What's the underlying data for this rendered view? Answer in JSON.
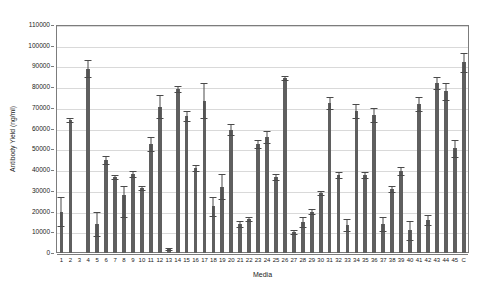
{
  "chart_data": {
    "type": "bar",
    "title": "",
    "xlabel": "Media",
    "ylabel": "Antibody Yield (ng/ml)",
    "ylim": [
      0,
      110000
    ],
    "ytick_step": 10000,
    "yticks": [
      "0",
      "10000",
      "20000",
      "30000",
      "40000",
      "50000",
      "60000",
      "70000",
      "80000",
      "90000",
      "100000",
      "110000"
    ],
    "grid": true,
    "legend": "none",
    "bar_color": "#5f5f5f",
    "error_bar_color": "#4a4a4a",
    "categories": [
      "1",
      "2",
      "3",
      "4",
      "5",
      "6",
      "7",
      "8",
      "9",
      "10",
      "11",
      "12",
      "13",
      "14",
      "15",
      "16",
      "17",
      "18",
      "19",
      "20",
      "21",
      "22",
      "23",
      "24",
      "25",
      "26",
      "27",
      "28",
      "29",
      "30",
      "31",
      "32",
      "33",
      "34",
      "35",
      "36",
      "37",
      "38",
      "39",
      "40",
      "41",
      "42",
      "43",
      "44",
      "45",
      "C"
    ],
    "values": [
      20000,
      64000,
      0,
      89000,
      14000,
      45000,
      36500,
      28000,
      38000,
      31500,
      52500,
      70500,
      2000,
      79000,
      66000,
      41000,
      73500,
      22500,
      32000,
      59500,
      14000,
      16500,
      52500,
      56000,
      36500,
      84500,
      10000,
      15000,
      20000,
      29000,
      72500,
      37500,
      13500,
      68500,
      37500,
      66500,
      14000,
      31000,
      39500,
      11000,
      72000,
      16000,
      82000,
      78000,
      50500,
      92000
    ],
    "errors_upper": [
      7000,
      1000,
      0,
      4000,
      6000,
      2000,
      1000,
      4500,
      1500,
      1000,
      3500,
      5500,
      500,
      1500,
      2500,
      1500,
      8500,
      4500,
      6000,
      2500,
      1500,
      1000,
      2000,
      3000,
      1500,
      1000,
      1000,
      2500,
      1000,
      1000,
      3000,
      1500,
      3000,
      3500,
      1500,
      3500,
      3500,
      1500,
      2000,
      4500,
      3500,
      2500,
      3000,
      4000,
      4000,
      4500
    ],
    "errors_lower": [
      7000,
      1000,
      0,
      4000,
      6000,
      2000,
      1000,
      10500,
      1500,
      1000,
      3500,
      5500,
      500,
      1500,
      2500,
      1500,
      8500,
      4500,
      6000,
      2500,
      1500,
      1000,
      2000,
      3000,
      1500,
      1000,
      1000,
      2500,
      1000,
      1000,
      3000,
      1500,
      3000,
      3500,
      1500,
      3500,
      3500,
      1500,
      2000,
      4500,
      3500,
      2500,
      3000,
      4000,
      4000,
      4500
    ]
  }
}
